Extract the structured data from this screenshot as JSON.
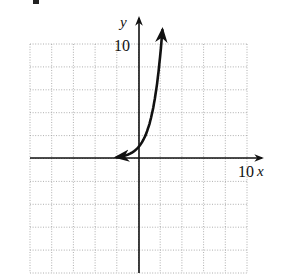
{
  "chart_data": {
    "type": "line",
    "title": "",
    "xlabel": "x",
    "ylabel": "y",
    "xlim": [
      -10,
      10
    ],
    "ylim": [
      -10,
      10
    ],
    "grid": true,
    "grid_step": 2,
    "tick_labels": {
      "x_max": "10",
      "y_max": "10"
    },
    "series": [
      {
        "name": "y = 3^x",
        "function": "3^x",
        "x": [
          -2,
          -1.5,
          -1,
          -0.5,
          0,
          0.5,
          1,
          1.5,
          2,
          2.2
        ],
        "values": [
          0.11,
          0.19,
          0.33,
          0.58,
          1,
          1.73,
          3,
          5.2,
          9,
          11.2
        ],
        "arrows": "both ends"
      }
    ],
    "legend": "none"
  },
  "labels": {
    "x_axis": "x",
    "y_axis": "y",
    "x_tick": "10",
    "y_tick": "10"
  }
}
